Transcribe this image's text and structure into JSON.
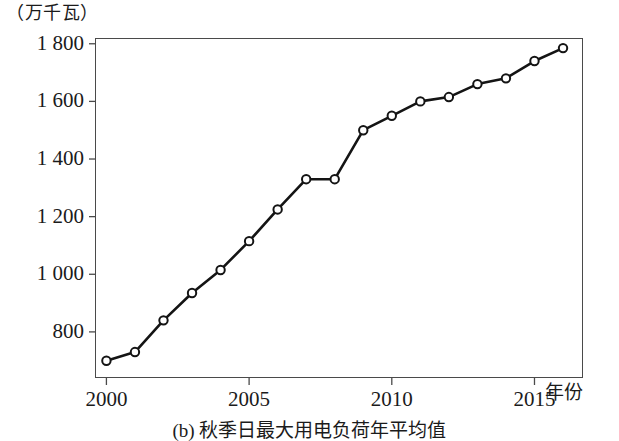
{
  "figure": {
    "y_unit_label": "（万千瓦）",
    "x_axis_name": "年份",
    "caption": "(b) 秋季日最大用电负荷年平均值"
  },
  "chart_data": {
    "type": "line",
    "title": "",
    "subtitle": "",
    "xlabel": "年份",
    "ylabel": "（万千瓦）",
    "x": [
      2000,
      2001,
      2002,
      2003,
      2004,
      2005,
      2006,
      2007,
      2008,
      2009,
      2010,
      2011,
      2012,
      2013,
      2014,
      2015,
      2016
    ],
    "values": [
      700,
      730,
      840,
      935,
      1015,
      1115,
      1225,
      1330,
      1330,
      1500,
      1550,
      1600,
      1615,
      1660,
      1680,
      1740,
      1785
    ],
    "series": [
      {
        "name": "秋季日最大用电负荷年平均值",
        "values": [
          700,
          730,
          840,
          935,
          1015,
          1115,
          1225,
          1330,
          1330,
          1500,
          1550,
          1600,
          1615,
          1660,
          1680,
          1740,
          1785
        ]
      }
    ],
    "ylim": [
      640,
      1820
    ],
    "xlim": [
      1999.6,
      2016.7
    ],
    "yticks": [
      800,
      1000,
      1200,
      1400,
      1600,
      1800
    ],
    "ytick_labels": [
      "800",
      "1 000",
      "1 200",
      "1 400",
      "1 600",
      "1 800"
    ],
    "xticks": [
      2000,
      2005,
      2010,
      2015
    ],
    "xtick_labels": [
      "2000",
      "2005",
      "2010",
      "2015"
    ],
    "grid": false,
    "legend": "none",
    "line_color": "#141414",
    "marker": "open-circle",
    "marker_face_color": "#ffffff",
    "marker_edge_color": "#141414"
  }
}
